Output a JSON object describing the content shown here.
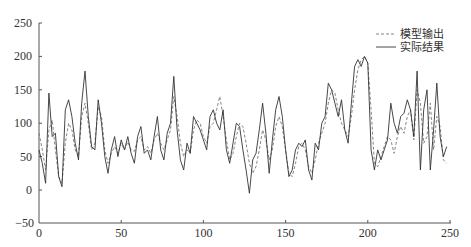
{
  "chart_data": {
    "type": "line",
    "title": "",
    "xlabel": "",
    "ylabel": "",
    "xlim": [
      0,
      250
    ],
    "ylim": [
      -50,
      250
    ],
    "x_ticks": [
      "0",
      "50",
      "100",
      "150",
      "200",
      "250"
    ],
    "y_ticks": [
      "-50",
      "0",
      "50",
      "100",
      "150",
      "200",
      "250"
    ],
    "grid": false,
    "legend_position": "upper right",
    "series": [
      {
        "name": "模型输出",
        "style": "dashed",
        "color": "#666666",
        "keypoints": [
          [
            0,
            85
          ],
          [
            2,
            60
          ],
          [
            4,
            30
          ],
          [
            6,
            90
          ],
          [
            8,
            105
          ],
          [
            10,
            60
          ],
          [
            12,
            20
          ],
          [
            14,
            10
          ],
          [
            16,
            70
          ],
          [
            18,
            100
          ],
          [
            20,
            90
          ],
          [
            22,
            60
          ],
          [
            24,
            50
          ],
          [
            26,
            110
          ],
          [
            28,
            130
          ],
          [
            30,
            100
          ],
          [
            32,
            60
          ],
          [
            34,
            70
          ],
          [
            36,
            125
          ],
          [
            38,
            110
          ],
          [
            40,
            60
          ],
          [
            42,
            40
          ],
          [
            44,
            55
          ],
          [
            46,
            65
          ],
          [
            48,
            55
          ],
          [
            50,
            70
          ],
          [
            52,
            60
          ],
          [
            54,
            72
          ],
          [
            56,
            60
          ],
          [
            58,
            58
          ],
          [
            60,
            75
          ],
          [
            62,
            80
          ],
          [
            64,
            60
          ],
          [
            66,
            65
          ],
          [
            68,
            55
          ],
          [
            70,
            75
          ],
          [
            72,
            85
          ],
          [
            74,
            70
          ],
          [
            76,
            60
          ],
          [
            78,
            75
          ],
          [
            80,
            90
          ],
          [
            82,
            140
          ],
          [
            84,
            110
          ],
          [
            86,
            70
          ],
          [
            88,
            50
          ],
          [
            90,
            60
          ],
          [
            92,
            55
          ],
          [
            94,
            90
          ],
          [
            96,
            105
          ],
          [
            98,
            100
          ],
          [
            100,
            80
          ],
          [
            102,
            70
          ],
          [
            104,
            95
          ],
          [
            106,
            100
          ],
          [
            108,
            120
          ],
          [
            110,
            140
          ],
          [
            112,
            110
          ],
          [
            114,
            75
          ],
          [
            116,
            45
          ],
          [
            118,
            55
          ],
          [
            120,
            80
          ],
          [
            122,
            100
          ],
          [
            124,
            95
          ],
          [
            126,
            70
          ],
          [
            128,
            40
          ],
          [
            130,
            25
          ],
          [
            132,
            35
          ],
          [
            134,
            60
          ],
          [
            136,
            90
          ],
          [
            138,
            75
          ],
          [
            140,
            45
          ],
          [
            142,
            60
          ],
          [
            144,
            95
          ],
          [
            146,
            110
          ],
          [
            148,
            95
          ],
          [
            150,
            60
          ],
          [
            152,
            25
          ],
          [
            154,
            20
          ],
          [
            156,
            40
          ],
          [
            158,
            65
          ],
          [
            160,
            70
          ],
          [
            162,
            60
          ],
          [
            164,
            35
          ],
          [
            166,
            25
          ],
          [
            168,
            45
          ],
          [
            170,
            70
          ],
          [
            172,
            85
          ],
          [
            174,
            100
          ],
          [
            176,
            130
          ],
          [
            178,
            150
          ],
          [
            180,
            145
          ],
          [
            182,
            120
          ],
          [
            184,
            100
          ],
          [
            186,
            90
          ],
          [
            188,
            80
          ],
          [
            190,
            110
          ],
          [
            192,
            150
          ],
          [
            194,
            180
          ],
          [
            196,
            195
          ],
          [
            198,
            200
          ],
          [
            200,
            190
          ],
          [
            202,
            120
          ],
          [
            204,
            40
          ],
          [
            206,
            35
          ],
          [
            208,
            50
          ],
          [
            210,
            65
          ],
          [
            212,
            80
          ],
          [
            214,
            75
          ],
          [
            216,
            55
          ],
          [
            218,
            80
          ],
          [
            220,
            95
          ],
          [
            222,
            85
          ],
          [
            224,
            110
          ],
          [
            226,
            120
          ],
          [
            228,
            75
          ],
          [
            230,
            150
          ],
          [
            232,
            130
          ],
          [
            234,
            70
          ],
          [
            236,
            80
          ],
          [
            238,
            130
          ],
          [
            240,
            60
          ],
          [
            242,
            110
          ],
          [
            244,
            95
          ],
          [
            246,
            45
          ],
          [
            248,
            40
          ]
        ]
      },
      {
        "name": "实际结果",
        "style": "solid",
        "color": "#333333",
        "keypoints": [
          [
            0,
            60
          ],
          [
            2,
            40
          ],
          [
            4,
            10
          ],
          [
            6,
            145
          ],
          [
            8,
            80
          ],
          [
            10,
            85
          ],
          [
            12,
            20
          ],
          [
            14,
            5
          ],
          [
            16,
            120
          ],
          [
            18,
            135
          ],
          [
            20,
            110
          ],
          [
            22,
            70
          ],
          [
            24,
            45
          ],
          [
            26,
            130
          ],
          [
            28,
            178
          ],
          [
            30,
            110
          ],
          [
            32,
            65
          ],
          [
            34,
            60
          ],
          [
            36,
            135
          ],
          [
            38,
            100
          ],
          [
            40,
            50
          ],
          [
            42,
            25
          ],
          [
            44,
            60
          ],
          [
            46,
            80
          ],
          [
            48,
            50
          ],
          [
            50,
            75
          ],
          [
            52,
            60
          ],
          [
            54,
            80
          ],
          [
            56,
            55
          ],
          [
            58,
            40
          ],
          [
            60,
            80
          ],
          [
            62,
            95
          ],
          [
            64,
            55
          ],
          [
            66,
            60
          ],
          [
            68,
            45
          ],
          [
            70,
            80
          ],
          [
            72,
            110
          ],
          [
            74,
            60
          ],
          [
            76,
            45
          ],
          [
            78,
            85
          ],
          [
            80,
            100
          ],
          [
            82,
            170
          ],
          [
            84,
            90
          ],
          [
            86,
            45
          ],
          [
            88,
            30
          ],
          [
            90,
            70
          ],
          [
            92,
            55
          ],
          [
            94,
            110
          ],
          [
            96,
            100
          ],
          [
            98,
            90
          ],
          [
            100,
            75
          ],
          [
            102,
            60
          ],
          [
            104,
            110
          ],
          [
            106,
            120
          ],
          [
            108,
            100
          ],
          [
            110,
            90
          ],
          [
            112,
            120
          ],
          [
            114,
            60
          ],
          [
            116,
            40
          ],
          [
            118,
            70
          ],
          [
            120,
            100
          ],
          [
            122,
            95
          ],
          [
            124,
            60
          ],
          [
            126,
            30
          ],
          [
            128,
            -5
          ],
          [
            130,
            45
          ],
          [
            132,
            55
          ],
          [
            134,
            90
          ],
          [
            136,
            130
          ],
          [
            138,
            85
          ],
          [
            140,
            25
          ],
          [
            142,
            75
          ],
          [
            144,
            120
          ],
          [
            146,
            140
          ],
          [
            148,
            110
          ],
          [
            150,
            60
          ],
          [
            152,
            20
          ],
          [
            154,
            30
          ],
          [
            156,
            60
          ],
          [
            158,
            70
          ],
          [
            160,
            65
          ],
          [
            162,
            75
          ],
          [
            164,
            30
          ],
          [
            166,
            15
          ],
          [
            168,
            70
          ],
          [
            170,
            60
          ],
          [
            172,
            100
          ],
          [
            174,
            110
          ],
          [
            176,
            160
          ],
          [
            178,
            150
          ],
          [
            180,
            130
          ],
          [
            182,
            110
          ],
          [
            184,
            135
          ],
          [
            186,
            90
          ],
          [
            188,
            70
          ],
          [
            190,
            130
          ],
          [
            192,
            185
          ],
          [
            194,
            195
          ],
          [
            196,
            185
          ],
          [
            198,
            200
          ],
          [
            200,
            190
          ],
          [
            202,
            60
          ],
          [
            204,
            30
          ],
          [
            206,
            60
          ],
          [
            208,
            45
          ],
          [
            210,
            60
          ],
          [
            212,
            75
          ],
          [
            214,
            130
          ],
          [
            216,
            100
          ],
          [
            218,
            85
          ],
          [
            220,
            110
          ],
          [
            222,
            115
          ],
          [
            224,
            135
          ],
          [
            226,
            120
          ],
          [
            228,
            80
          ],
          [
            230,
            178
          ],
          [
            232,
            30
          ],
          [
            234,
            120
          ],
          [
            236,
            150
          ],
          [
            238,
            30
          ],
          [
            240,
            90
          ],
          [
            242,
            160
          ],
          [
            244,
            80
          ],
          [
            246,
            50
          ],
          [
            248,
            65
          ]
        ]
      }
    ]
  },
  "legend": {
    "items": [
      {
        "label": "模型输出",
        "style": "dashed"
      },
      {
        "label": "实际结果",
        "style": "solid"
      }
    ]
  },
  "axes": {
    "x_ticks": [
      "0",
      "50",
      "100",
      "150",
      "200",
      "250"
    ],
    "y_ticks": [
      "250",
      "200",
      "150",
      "100",
      "50",
      "0",
      "−50"
    ]
  }
}
